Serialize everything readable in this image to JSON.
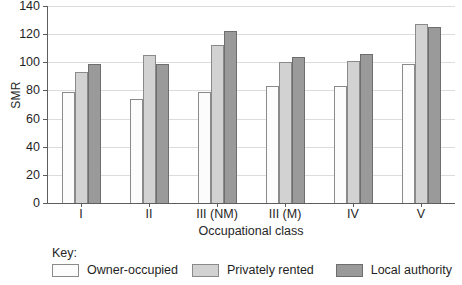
{
  "chart_data": {
    "type": "bar",
    "title": "",
    "xlabel": "Occupational class",
    "ylabel": "SMR",
    "categories": [
      "I",
      "II",
      "III (NM)",
      "III (M)",
      "IV",
      "V"
    ],
    "series": [
      {
        "name": "Owner-occupied",
        "color": "#fcfcfc",
        "values": [
          79,
          74,
          79,
          83,
          83,
          99
        ]
      },
      {
        "name": "Privately rented",
        "color": "#d2d2d2",
        "values": [
          93,
          105,
          112,
          100,
          101,
          127
        ]
      },
      {
        "name": "Local authority",
        "color": "#9a9a9a",
        "values": [
          99,
          99,
          122,
          104,
          106,
          125
        ]
      }
    ],
    "ylim": [
      0,
      140
    ],
    "yticks": [
      0,
      20,
      40,
      60,
      80,
      100,
      120,
      140
    ],
    "grid": true,
    "legend_position": "below",
    "legend_title": "Key:"
  }
}
